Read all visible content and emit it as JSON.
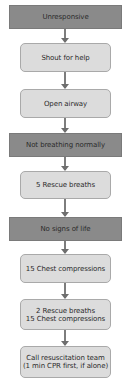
{
  "flowchart": {
    "nodes": [
      {
        "id": "unresponsive",
        "label": "Unresponsive",
        "style": "dark"
      },
      {
        "id": "shout-for-help",
        "label": "Shout for help",
        "style": "light"
      },
      {
        "id": "open-airway",
        "label": "Open airway",
        "style": "light"
      },
      {
        "id": "not-breathing-normally",
        "label": "Not breathing normally",
        "style": "dark"
      },
      {
        "id": "five-rescue-breaths",
        "label": "5 Rescue breaths",
        "style": "light"
      },
      {
        "id": "no-signs-of-life",
        "label": "No signs of life",
        "style": "dark"
      },
      {
        "id": "fifteen-chest-compressions",
        "label": "15 Chest compressions",
        "style": "light"
      },
      {
        "id": "two-breaths-fifteen-compressions",
        "lines": [
          "2 Rescue breaths",
          "15 Chest compressions"
        ],
        "style": "light"
      },
      {
        "id": "call-resuscitation-team",
        "lines": [
          "Call resuscitation team",
          "(1 min CPR first, if alone)"
        ],
        "style": "light"
      }
    ],
    "colors": {
      "dark_fill": "#8a8a8a",
      "light_fill": "#dcdcdc",
      "light_border": "#a9a9a9",
      "arrow": "#7d7d7d",
      "text": "#2b2b2b"
    }
  }
}
